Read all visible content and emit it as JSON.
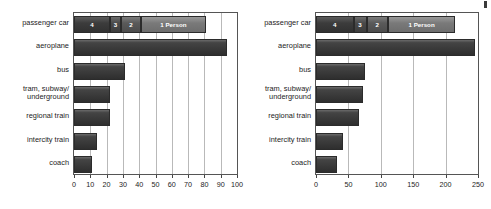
{
  "figure": {
    "background": "#ffffff",
    "bar_color": "#3a3a3a",
    "grid_color": "#b9b9b9",
    "axis_color": "#555555",
    "corner_mark": "corner-mark"
  },
  "chart_data": [
    {
      "type": "bar",
      "id": "left-chart",
      "orientation": "horizontal",
      "title": "",
      "xlabel": "",
      "ylabel": "",
      "grid": true,
      "legend": "inline-segment-labels",
      "xlim": [
        0,
        100
      ],
      "xticks": [
        0,
        10,
        20,
        30,
        40,
        50,
        60,
        70,
        80,
        90,
        100
      ],
      "categories": [
        "passenger car",
        "aeroplane",
        "bus",
        "tram, subway/ underground",
        "regional train",
        "intercity train",
        "coach"
      ],
      "values": [
        81,
        94,
        31,
        22,
        22,
        14,
        11
      ],
      "stacked_first_bar": {
        "category": "passenger car",
        "total": 81,
        "segments": [
          {
            "label": "4",
            "value": 22,
            "occupancy": "4 persons"
          },
          {
            "label": "3",
            "value": 7,
            "occupancy": "3 persons"
          },
          {
            "label": "2",
            "value": 12,
            "occupancy": "2 persons"
          },
          {
            "label": "1 Person",
            "value": 40,
            "occupancy": "1 person"
          }
        ]
      }
    },
    {
      "type": "bar",
      "id": "right-chart",
      "orientation": "horizontal",
      "title": "",
      "xlabel": "",
      "ylabel": "",
      "grid": true,
      "legend": "inline-segment-labels",
      "xlim": [
        0,
        250
      ],
      "xticks": [
        0,
        50,
        100,
        150,
        200,
        250
      ],
      "categories": [
        "passenger car",
        "aeroplane",
        "bus",
        "tram, subway/ underground",
        "regional train",
        "intercity train",
        "coach"
      ],
      "values": [
        215,
        245,
        76,
        72,
        67,
        41,
        33
      ],
      "stacked_first_bar": {
        "category": "passenger car",
        "total": 215,
        "segments": [
          {
            "label": "4",
            "value": 58,
            "occupancy": "4 persons"
          },
          {
            "label": "3",
            "value": 20,
            "occupancy": "3 persons"
          },
          {
            "label": "2",
            "value": 33,
            "occupancy": "2 persons"
          },
          {
            "label": "1 Person",
            "value": 104,
            "occupancy": "1 person"
          }
        ]
      }
    }
  ]
}
